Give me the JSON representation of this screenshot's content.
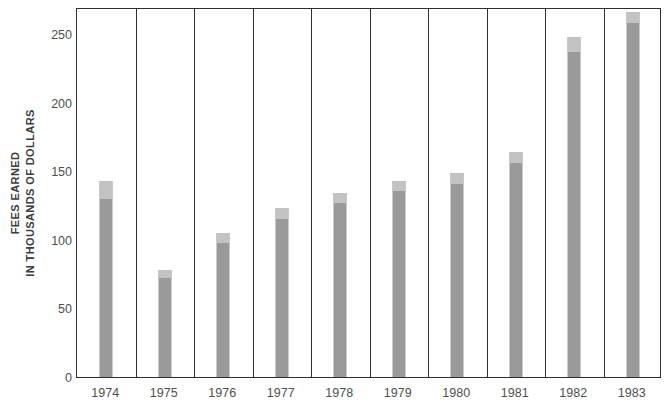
{
  "chart_data": {
    "type": "bar",
    "title": "",
    "subtitle": "",
    "xlabel": "",
    "ylabel": "FEES EARNED IN THOUSANDS OF DOLLARS",
    "ylabel_line1": "FEES EARNED",
    "ylabel_line2": "IN THOUSANDS OF DOLLARS",
    "categories": [
      "1974",
      "1975",
      "1976",
      "1977",
      "1978",
      "1979",
      "1980",
      "1981",
      "1982",
      "1983"
    ],
    "values": [
      143,
      78,
      105,
      123,
      134,
      143,
      149,
      164,
      248,
      266
    ],
    "values_dark_segment": [
      130,
      72,
      98,
      115,
      127,
      136,
      141,
      156,
      237,
      258
    ],
    "ylim": [
      0,
      270
    ],
    "yticks": [
      0,
      50,
      100,
      150,
      200,
      250
    ],
    "ytick_labels": [
      "0",
      "50",
      "100",
      "150",
      "200",
      "250"
    ],
    "grid": false,
    "legend": null,
    "legend_position": "none",
    "annotations": [],
    "bar_color": "#9a9a9a",
    "bar_cap_color": "#c3c3c3",
    "frame_color": "#2e2e2e",
    "separator_color": "#2e2e2e",
    "background_color": "#ffffff",
    "text_color": "#4f4f4f",
    "axis_title_color": "#3d3d3d"
  }
}
